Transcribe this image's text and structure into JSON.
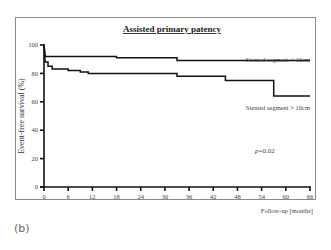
{
  "figure": {
    "panel_label": "(b)"
  },
  "chart_data": {
    "type": "line",
    "subtype": "kaplan-meier step",
    "title": "Assisted primary patency",
    "xlabel": "Follow-up [months]",
    "ylabel": "Event-free survival (%)",
    "xlim": [
      0,
      66
    ],
    "ylim": [
      0,
      100
    ],
    "x_ticks": [
      "0",
      "6",
      "12",
      "18",
      "24",
      "30",
      "36",
      "42",
      "48",
      "54",
      "60",
      "66"
    ],
    "y_ticks": [
      "0",
      "20",
      "40",
      "60",
      "80",
      "100"
    ],
    "grid": false,
    "legend_position": "inline labels right",
    "annotation": "p=0.02",
    "series": [
      {
        "name": "Stented segment < 10cm",
        "steps": [
          [
            0,
            100
          ],
          [
            0.3,
            92
          ],
          [
            18,
            92
          ],
          [
            18,
            91
          ],
          [
            33,
            91
          ],
          [
            33,
            89
          ],
          [
            66,
            89
          ]
        ]
      },
      {
        "name": "Stented segment > 10cm",
        "steps": [
          [
            0,
            100
          ],
          [
            0.3,
            88
          ],
          [
            1,
            88
          ],
          [
            1,
            85
          ],
          [
            2,
            85
          ],
          [
            2,
            83
          ],
          [
            6,
            83
          ],
          [
            6,
            82
          ],
          [
            9,
            82
          ],
          [
            9,
            81
          ],
          [
            11,
            81
          ],
          [
            11,
            80
          ],
          [
            18,
            80
          ],
          [
            18,
            80
          ],
          [
            33,
            80
          ],
          [
            33,
            78
          ],
          [
            45,
            78
          ],
          [
            45,
            75
          ],
          [
            57,
            75
          ],
          [
            57,
            64
          ],
          [
            66,
            64
          ]
        ]
      }
    ]
  }
}
